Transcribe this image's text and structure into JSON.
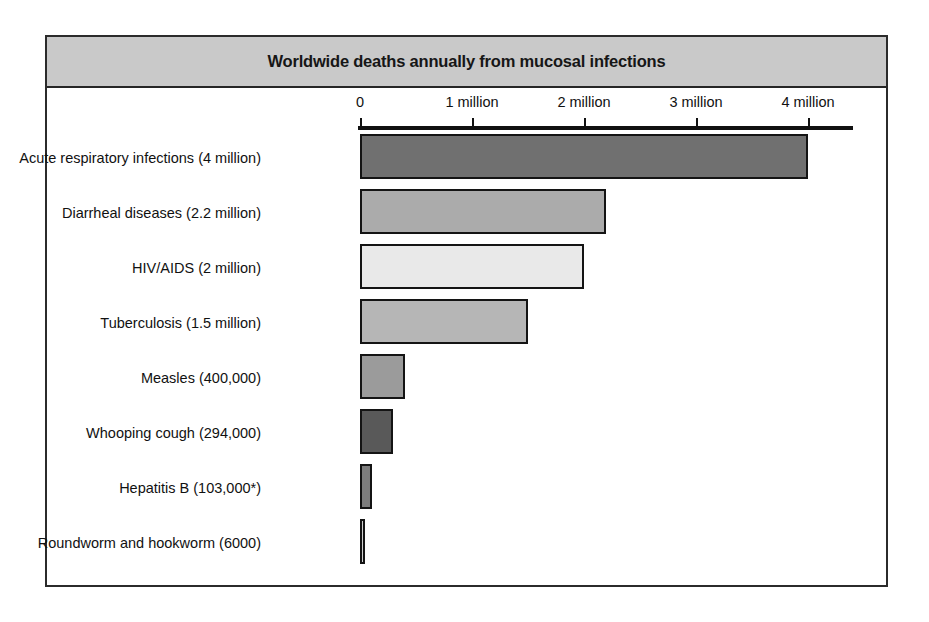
{
  "figure": {
    "title": "Worldwide deaths annually from mucosal infections",
    "title_bar_color": "#c9c9c9",
    "frame_color": "#2b2b2b",
    "background": "#ffffff"
  },
  "axis": {
    "ticks": [
      {
        "label": "0",
        "value": 0
      },
      {
        "label": "1 million",
        "value": 1000000
      },
      {
        "label": "2 million",
        "value": 2000000
      },
      {
        "label": "3 million",
        "value": 3000000
      },
      {
        "label": "4 million",
        "value": 4000000
      }
    ],
    "range": [
      0,
      4400000
    ],
    "line_color": "#111111"
  },
  "chart_data": {
    "type": "bar",
    "orientation": "horizontal",
    "title": "Worldwide deaths annually from mucosal infections",
    "xlabel": "",
    "ylabel": "",
    "xlim": [
      0,
      4400000
    ],
    "grid": false,
    "legend": false,
    "tick_labels": [
      "0",
      "1 million",
      "2 million",
      "3 million",
      "4 million"
    ],
    "tick_values": [
      0,
      1000000,
      2000000,
      3000000,
      4000000
    ],
    "categories": [
      "Acute respiratory infections",
      "Diarrheal diseases",
      "HIV/AIDS",
      "Tuberculosis",
      "Measles",
      "Whooping cough",
      "Hepatitis B",
      "Roundworm and hookworm"
    ],
    "value_labels": [
      "4 million",
      "2.2 million",
      "2 million",
      "1.5 million",
      "400,000",
      "294,000",
      "103,000*",
      "6000"
    ],
    "values": [
      4000000,
      2200000,
      2000000,
      1500000,
      400000,
      294000,
      103000,
      6000
    ],
    "bars": [
      {
        "label": "Acute respiratory infections (4 million)",
        "category": "Acute respiratory infections",
        "value": 4000000,
        "value_label": "4 million",
        "color": "#707070"
      },
      {
        "label": "Diarrheal diseases (2.2 million)",
        "category": "Diarrheal diseases",
        "value": 2200000,
        "value_label": "2.2 million",
        "color": "#ababab"
      },
      {
        "label": "HIV/AIDS (2 million)",
        "category": "HIV/AIDS",
        "value": 2000000,
        "value_label": "2 million",
        "color": "#e9e9e9"
      },
      {
        "label": "Tuberculosis (1.5 million)",
        "category": "Tuberculosis",
        "value": 1500000,
        "value_label": "1.5 million",
        "color": "#b6b6b6"
      },
      {
        "label": "Measles (400,000)",
        "category": "Measles",
        "value": 400000,
        "value_label": "400,000",
        "color": "#9b9b9b"
      },
      {
        "label": "Whooping cough (294,000)",
        "category": "Whooping cough",
        "value": 294000,
        "value_label": "294,000",
        "color": "#595959"
      },
      {
        "label": "Hepatitis B (103,000*)",
        "category": "Hepatitis B",
        "value": 103000,
        "value_label": "103,000*",
        "color": "#7d7d7d"
      },
      {
        "label": "Roundworm and hookworm (6000)",
        "category": "Roundworm and hookworm",
        "value": 6000,
        "value_label": "6000",
        "color": "#d0d0d0"
      }
    ]
  }
}
